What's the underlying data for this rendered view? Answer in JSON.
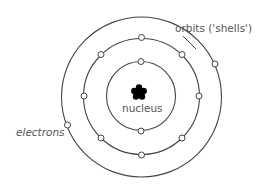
{
  "diagram": {
    "type": "bohr-atom-model",
    "labels": {
      "orbits": "orbits ('shells')",
      "electrons": "electrons",
      "nucleus": "nucleus"
    },
    "colors": {
      "line": "#444444",
      "text": "#555555",
      "nucleus": "#000000",
      "electron_fill": "#ffffff",
      "background": "#ffffff"
    },
    "shells": [
      {
        "name": "inner",
        "electron_count": 2
      },
      {
        "name": "middle",
        "electron_count": 8
      },
      {
        "name": "outer",
        "electron_count": 2
      }
    ]
  }
}
